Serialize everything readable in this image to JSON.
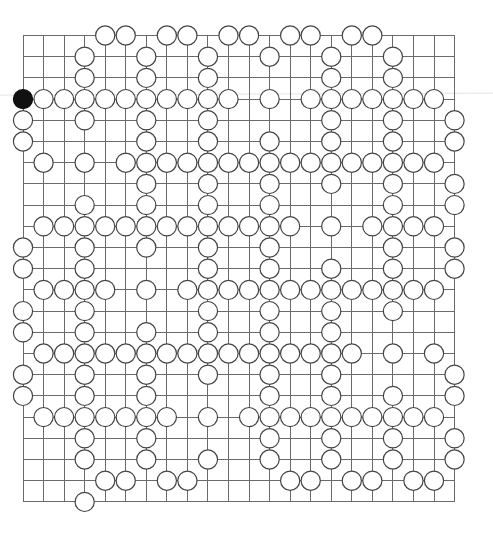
{
  "board": {
    "title": "Go-style grid puzzle",
    "columns": 22,
    "rows": 23,
    "origin": {
      "x": 23,
      "y": 35.5
    },
    "spacing": {
      "x": 20.55,
      "y": 21.2
    },
    "stone_radius": 9.6,
    "colors": {
      "grid_line": "#6a6a6a",
      "white_stone_fill": "#ffffff",
      "stone_stroke": "#444444",
      "black_stone_fill": "#111111",
      "background": "#ffffff"
    },
    "black_stones": [
      [
        3,
        0
      ]
    ],
    "white_stones_by_row": [
      [
        4,
        5,
        7,
        8,
        10,
        11,
        13,
        14,
        16,
        17
      ],
      [
        3,
        6,
        9,
        12,
        15,
        18
      ],
      [
        3,
        6,
        9,
        15,
        18
      ],
      [
        1,
        2,
        3,
        4,
        5,
        6,
        7,
        8,
        9,
        10,
        12,
        14,
        15,
        16,
        17,
        18,
        19,
        20
      ],
      [
        0,
        3,
        6,
        9,
        15,
        18,
        21
      ],
      [
        0,
        6,
        9,
        12,
        15,
        18,
        21
      ],
      [
        1,
        3,
        5,
        6,
        7,
        8,
        9,
        10,
        11,
        12,
        13,
        14,
        15,
        16,
        17,
        18,
        19,
        20
      ],
      [
        6,
        9,
        12,
        15,
        18,
        21
      ],
      [
        3,
        6,
        9,
        12,
        18,
        21
      ],
      [
        1,
        2,
        3,
        4,
        5,
        6,
        7,
        8,
        9,
        10,
        11,
        12,
        13,
        15,
        17,
        18,
        19,
        20
      ],
      [
        0,
        3,
        6,
        9,
        12,
        18,
        21
      ],
      [
        0,
        3,
        9,
        12,
        15,
        18,
        21
      ],
      [
        1,
        2,
        3,
        4,
        6,
        8,
        9,
        10,
        11,
        12,
        13,
        14,
        15,
        16,
        17,
        18,
        19,
        20
      ],
      [
        0,
        3,
        9,
        12,
        15,
        18
      ],
      [
        0,
        3,
        6,
        9,
        12,
        15
      ],
      [
        1,
        2,
        3,
        4,
        5,
        6,
        7,
        8,
        9,
        10,
        11,
        12,
        13,
        14,
        15,
        16,
        18,
        20
      ],
      [
        0,
        3,
        6,
        9,
        12,
        15,
        21
      ],
      [
        0,
        3,
        6,
        12,
        15,
        18,
        21
      ],
      [
        1,
        2,
        3,
        4,
        5,
        6,
        7,
        9,
        11,
        12,
        13,
        14,
        15,
        16,
        17,
        18,
        19,
        20
      ],
      [
        3,
        6,
        12,
        15,
        18,
        21
      ],
      [
        3,
        6,
        9,
        12,
        15,
        18,
        21
      ],
      [
        4,
        5,
        7,
        8,
        13,
        14,
        16,
        17,
        19,
        20
      ],
      [
        3
      ]
    ]
  }
}
